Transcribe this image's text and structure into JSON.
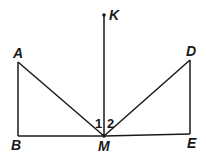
{
  "figure": {
    "points": {
      "K": {
        "label": "K",
        "x": 104,
        "y": 15
      },
      "A": {
        "label": "A",
        "x": 18,
        "y": 62
      },
      "B": {
        "label": "B",
        "x": 18,
        "y": 136
      },
      "M": {
        "label": "M",
        "x": 104,
        "y": 136
      },
      "E": {
        "label": "E",
        "x": 190,
        "y": 134
      },
      "D": {
        "label": "D",
        "x": 190,
        "y": 60
      }
    },
    "angles": {
      "angle1": "1",
      "angle2": "2"
    },
    "segments": [
      "KM",
      "AB",
      "AM",
      "BM",
      "ME",
      "DM",
      "DE"
    ],
    "colors": {
      "stroke": "#1a1a1a",
      "background": "#ffffff"
    }
  }
}
